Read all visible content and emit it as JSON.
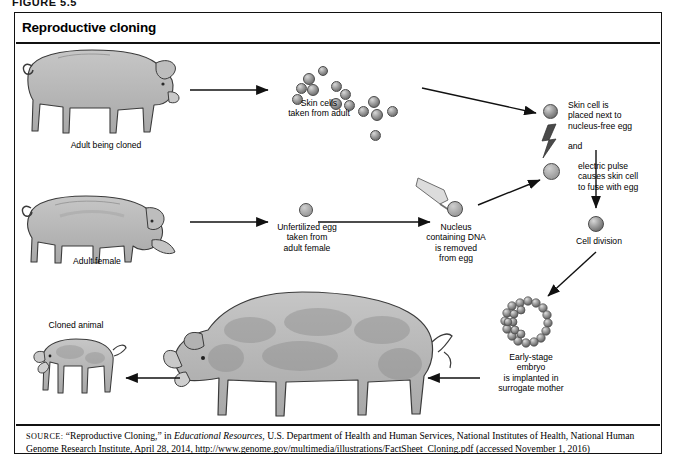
{
  "figure": {
    "label": "FIGURE 5.5",
    "panel_title": "Reproductive cloning"
  },
  "diagram": {
    "type": "process-flow-diagram",
    "steps": [
      {
        "id": "adult-being-cloned",
        "label": "Adult being cloned",
        "icon": "pig-standing"
      },
      {
        "id": "skin-cells",
        "label": "Skin cells\ntaken from adult",
        "icon": "cell-cluster",
        "cell_count": 14
      },
      {
        "id": "skin-cell-placed",
        "label": "Skin cell is\nplaced next to\nnucleus-free egg",
        "icon": "single-cell"
      },
      {
        "id": "conjunction",
        "label": "and"
      },
      {
        "id": "electric-pulse",
        "label": "electric pulse\ncauses skin cell\nto fuse with egg",
        "icon": "lightning-bolt"
      },
      {
        "id": "cell-division",
        "label": "Cell division",
        "icon": "single-cell"
      },
      {
        "id": "adult-female",
        "label": "Adult female",
        "icon": "pig-grazing"
      },
      {
        "id": "unfertilized-egg",
        "label": "Unfertilized egg\ntaken from\nadult female",
        "icon": "egg-cell"
      },
      {
        "id": "nucleus-removed",
        "label": "Nucleus\ncontaining DNA\nis removed\nfrom egg",
        "icon": "pipette-and-egg"
      },
      {
        "id": "early-embryo",
        "label": "Early-stage\nembryo\nis implanted in\nsurrogate mother",
        "icon": "blastocyst"
      },
      {
        "id": "surrogate-mother",
        "label": "",
        "icon": "pig-pregnant"
      },
      {
        "id": "cloned-animal",
        "label": "Cloned animal",
        "icon": "piglet"
      }
    ]
  },
  "source": {
    "prefix": "SOURCE:",
    "line": " “Reproductive Cloning,” in ",
    "italic_title": "Educational Resources",
    "rest": ", U.S. Department of Health and Human Services, National Institutes of Health, National Human Genome Research Institute, April 28, 2014, http://www.genome.gov/multimedia/illustrations/FactSheet_Cloning.pdf (accessed November 1, 2016)"
  },
  "colors": {
    "border": "#111111",
    "pig_body": "#b9b9b9",
    "pig_shade": "#9a9a9a",
    "cell_fill": "#9e9e9e",
    "background": "#ffffff"
  }
}
